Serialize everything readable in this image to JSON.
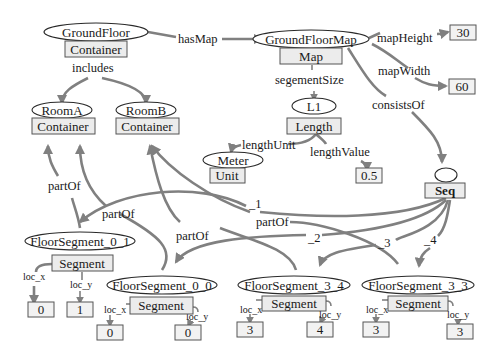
{
  "diagram": {
    "nodes": {
      "ground_floor": {
        "label": "GroundFloor",
        "type": "Container"
      },
      "ground_floor_map": {
        "label": "GroundFloorMap",
        "type": "Map"
      },
      "room_a": {
        "label": "RoomA",
        "type": "Container"
      },
      "room_b": {
        "label": "RoomB",
        "type": "Container"
      },
      "l1": {
        "label": "L1",
        "type": "Length"
      },
      "meter": {
        "label": "Meter",
        "type": "Unit"
      },
      "seq": {
        "label": "",
        "type": "Seq"
      },
      "fs_0_1": {
        "label": "FloorSegment_0_1",
        "type": "Segment"
      },
      "fs_0_0": {
        "label": "FloorSegment_0_0",
        "type": "Segment"
      },
      "fs_3_4": {
        "label": "FloorSegment_3_4",
        "type": "Segment"
      },
      "fs_3_3": {
        "label": "FloorSegment_3_3",
        "type": "Segment"
      }
    },
    "values": {
      "map_height": "30",
      "map_width": "60",
      "length_value": "0.5",
      "fs_0_1_x": "0",
      "fs_0_1_y": "1",
      "fs_0_0_x": "0",
      "fs_0_0_y": "0",
      "fs_3_4_x": "3",
      "fs_3_4_y": "4",
      "fs_3_3_x": "3",
      "fs_3_3_y": "3"
    },
    "edges": {
      "has_map": "hasMap",
      "includes": "includes",
      "map_height": "mapHeight",
      "map_width": "mapWidth",
      "segment_size": "segementSize",
      "consists_of": "consistsOf",
      "length_unit": "lengthUnit",
      "length_value": "lengthValue",
      "part_of": "partOf",
      "seq_1": "_1",
      "seq_2": "_2",
      "seq_3": "_3",
      "seq_4": "_4",
      "loc_x": "loc_x",
      "loc_y": "loc_y"
    }
  }
}
